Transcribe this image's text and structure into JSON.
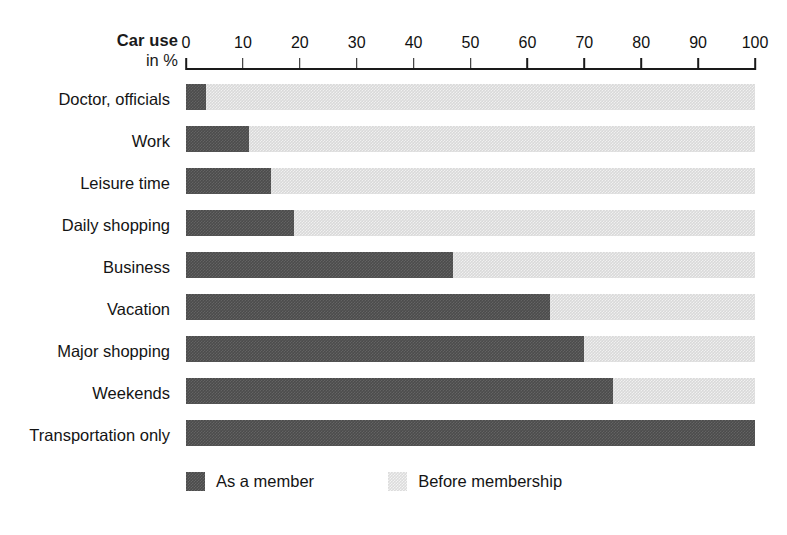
{
  "chart_data": {
    "type": "bar",
    "orientation": "horizontal",
    "title": "",
    "axis_title_line1": "Car use",
    "axis_title_line2": "in %",
    "xlabel": "",
    "ylabel": "",
    "xlim": [
      0,
      100
    ],
    "grid": false,
    "tick_labels": [
      "0",
      "10",
      "20",
      "30",
      "40",
      "50",
      "60",
      "70",
      "80",
      "90",
      "100"
    ],
    "ticks": [
      0,
      10,
      20,
      30,
      40,
      50,
      60,
      70,
      80,
      90,
      100
    ],
    "categories": [
      "Doctor, officials",
      "Work",
      "Leisure time",
      "Daily shopping",
      "Business",
      "Vacation",
      "Major shopping",
      "Weekends",
      "Transportation only"
    ],
    "series": [
      {
        "name": "As a member",
        "color": "#4c4c4c",
        "values": [
          3.5,
          11,
          15,
          19,
          47,
          64,
          70,
          75,
          100
        ]
      },
      {
        "name": "Before membership",
        "color": "#dcdcdc",
        "values": [
          100,
          100,
          100,
          100,
          100,
          100,
          100,
          100,
          100
        ]
      }
    ],
    "legend": {
      "position": "bottom",
      "entries": [
        {
          "label": "As a member",
          "swatch": "dark"
        },
        {
          "label": "Before membership",
          "swatch": "light"
        }
      ]
    }
  }
}
